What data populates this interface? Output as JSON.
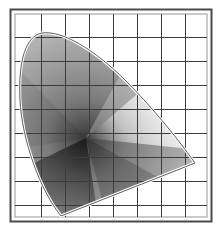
{
  "diagram": {
    "colors": {
      "background": "#ffffff",
      "frame_outer": "#4a4a4a",
      "frame_inner": "#a8a8a8",
      "grid": "#3c3c3c",
      "gamut_outline": "#ffffff",
      "gamut_edge": "#333333"
    },
    "grid": {
      "columns": 8,
      "rows": 8
    }
  }
}
